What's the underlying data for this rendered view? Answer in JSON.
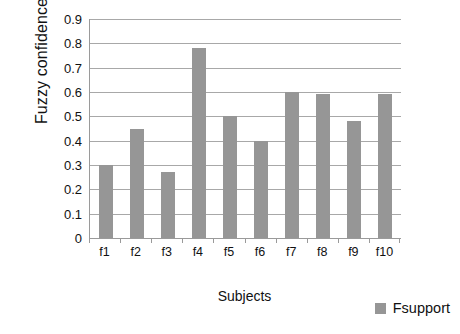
{
  "chart_data": {
    "type": "bar",
    "title": "",
    "xlabel": "Subjects",
    "ylabel": "Fuzzy confidence",
    "categories": [
      "f1",
      "f2",
      "f3",
      "f4",
      "f5",
      "f6",
      "f7",
      "f8",
      "f9",
      "f10"
    ],
    "series": [
      {
        "name": "Fsupport",
        "color": "#969696",
        "values": [
          0.3,
          0.45,
          0.27,
          0.78,
          0.5,
          0.4,
          0.6,
          0.59,
          0.48,
          0.59
        ]
      }
    ],
    "ylim": [
      0,
      0.9
    ],
    "ytick_labels": [
      "0.9",
      "0.8",
      "0.7",
      "0.6",
      "0.5",
      "0.4",
      "0.3",
      "0.2",
      "0.1",
      "0"
    ],
    "ytick_values": [
      0.9,
      0.8,
      0.7,
      0.6,
      0.5,
      0.4,
      0.3,
      0.2,
      0.1,
      0
    ],
    "grid": true,
    "legend": {
      "position": "bottom-right",
      "entries": [
        {
          "label": "Fsupport",
          "color": "#969696"
        }
      ]
    },
    "gridline_color": "#a8a8a8",
    "axis_color": "#9a9a9a",
    "background": "#ffffff"
  }
}
